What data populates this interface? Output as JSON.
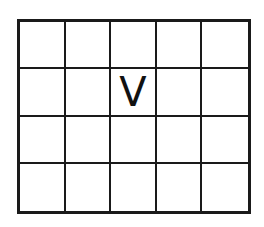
{
  "grid": {
    "rows": 4,
    "cols": 5,
    "line_color": "#1a1a1a",
    "cells": [
      [
        "",
        "",
        "",
        "",
        ""
      ],
      [
        "",
        "",
        "V",
        "",
        ""
      ],
      [
        "",
        "",
        "",
        "",
        ""
      ],
      [
        "",
        "",
        "",
        "",
        ""
      ]
    ]
  }
}
